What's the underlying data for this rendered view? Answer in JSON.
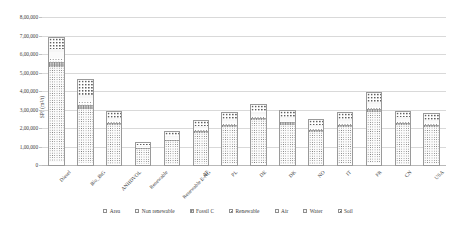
{
  "chart_data": {
    "type": "bar",
    "stacked": true,
    "title": "",
    "xlabel": "",
    "ylabel": "SPI (m²/t)",
    "ylim": [
      0,
      800000
    ],
    "ytick_values": [
      0,
      100000,
      200000,
      300000,
      400000,
      500000,
      600000,
      700000,
      800000
    ],
    "ytick_labels": [
      "0",
      "1,00,000",
      "2,00,000",
      "3,00,000",
      "4,00,000",
      "5,00,000",
      "6,00,000",
      "7,00,000",
      "8,00,000"
    ],
    "grid": true,
    "legend_position": "bottom",
    "categories": [
      "Diesel",
      "Bio_BtG",
      "ANHDVOL",
      "Renewable",
      "Renewable E-NG",
      "AT",
      "PL",
      "DE",
      "DK",
      "NO",
      "IT",
      "FR",
      "CN",
      "USA"
    ],
    "series": [
      {
        "name": "Area",
        "texture": "tex-area",
        "values": [
          18000,
          12000,
          8000,
          4000,
          5000,
          7000,
          8000,
          9000,
          8000,
          7000,
          8000,
          10000,
          8000,
          8000
        ]
      },
      {
        "name": "Non renewable",
        "texture": "tex-nonren",
        "values": [
          520000,
          300000,
          215000,
          88000,
          130000,
          175000,
          205000,
          240000,
          218000,
          182000,
          205000,
          285000,
          215000,
          205000
        ]
      },
      {
        "name": "Fossil C",
        "texture": "tex-fossil",
        "values": [
          30000,
          22000,
          12000,
          6000,
          9000,
          11000,
          13000,
          14000,
          13000,
          11000,
          13000,
          17000,
          13000,
          12000
        ]
      },
      {
        "name": "Renewable",
        "texture": "tex-ren",
        "values": [
          22000,
          18000,
          10000,
          5000,
          7000,
          9000,
          10000,
          11000,
          10000,
          9000,
          10000,
          13000,
          10000,
          10000
        ]
      },
      {
        "name": "Air",
        "texture": "tex-air",
        "values": [
          28000,
          20000,
          12000,
          6000,
          8000,
          10000,
          12000,
          13000,
          12000,
          10000,
          12000,
          15000,
          12000,
          11000
        ]
      },
      {
        "name": "Water",
        "texture": "tex-water",
        "values": [
          20000,
          15000,
          9000,
          4000,
          6000,
          8000,
          9000,
          10000,
          9000,
          8000,
          9000,
          12000,
          9000,
          9000
        ]
      },
      {
        "name": "Soil",
        "texture": "tex-soil",
        "values": [
          62000,
          83000,
          34000,
          17000,
          25000,
          30000,
          33000,
          38000,
          35000,
          28000,
          33000,
          48000,
          33000,
          30000
        ]
      }
    ],
    "totals": [
      700000,
      470000,
      300000,
      130000,
      190000,
      250000,
      290000,
      335000,
      305000,
      255000,
      290000,
      400000,
      300000,
      285000
    ]
  }
}
